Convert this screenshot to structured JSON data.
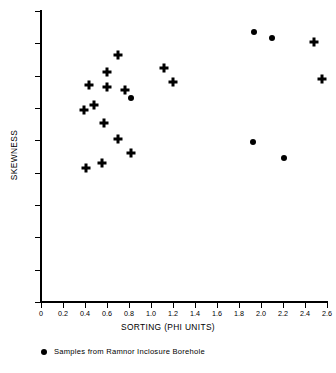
{
  "chart_data": {
    "type": "scatter",
    "title": "",
    "xlabel": "SORTING (PHI UNITS)",
    "ylabel": "SKEWNESS",
    "xlim": [
      0,
      2.6
    ],
    "ylim": [
      -1.0,
      0.8
    ],
    "grid": false,
    "legend_position": "below-axis-left",
    "xticks": [
      "0",
      "0.2",
      "0.4",
      "0.6",
      "0.8",
      "1.0",
      "1.2",
      "1.4",
      "1.6",
      "1.8",
      "2.0",
      "2.2",
      "2.4",
      "2.6"
    ],
    "xtick_values": [
      0,
      0.2,
      0.4,
      0.6,
      0.8,
      1.0,
      1.2,
      1.4,
      1.6,
      1.8,
      2.0,
      2.2,
      2.4,
      2.6
    ],
    "yticks": [
      "+0.8",
      "+0.6",
      "+0.4",
      "+0.2",
      "0",
      "-0.2",
      "-0.4",
      "-0.6",
      "-0.8",
      "-1.0"
    ],
    "ytick_values": [
      0.8,
      0.6,
      0.4,
      0.2,
      0,
      -0.2,
      -0.4,
      -0.6,
      -0.8,
      -1.0
    ],
    "series": [
      {
        "name": "Other samples",
        "marker": "plus",
        "color": "#000000",
        "points": [
          {
            "x": 0.39,
            "y": 0.19
          },
          {
            "x": 0.41,
            "y": -0.17
          },
          {
            "x": 0.44,
            "y": 0.34
          },
          {
            "x": 0.48,
            "y": 0.22
          },
          {
            "x": 0.55,
            "y": -0.14
          },
          {
            "x": 0.57,
            "y": 0.11
          },
          {
            "x": 0.6,
            "y": 0.42
          },
          {
            "x": 0.6,
            "y": 0.33
          },
          {
            "x": 0.7,
            "y": 0.53
          },
          {
            "x": 0.7,
            "y": 0.01
          },
          {
            "x": 0.76,
            "y": 0.31
          },
          {
            "x": 0.82,
            "y": -0.08
          },
          {
            "x": 1.12,
            "y": 0.45
          },
          {
            "x": 1.2,
            "y": 0.36
          },
          {
            "x": 2.48,
            "y": 0.61
          },
          {
            "x": 2.55,
            "y": 0.38
          }
        ]
      },
      {
        "name": "Samples from Ramnor Inclosure Borehole",
        "marker": "circle",
        "color": "#000000",
        "points": [
          {
            "x": 0.82,
            "y": 0.26
          },
          {
            "x": 1.94,
            "y": 0.67
          },
          {
            "x": 2.1,
            "y": 0.63
          },
          {
            "x": 1.93,
            "y": -0.01
          },
          {
            "x": 2.21,
            "y": -0.11
          }
        ]
      }
    ],
    "legend": [
      {
        "marker": "circle",
        "label": "Samples from Ramnor Inclosure Borehole"
      }
    ]
  }
}
